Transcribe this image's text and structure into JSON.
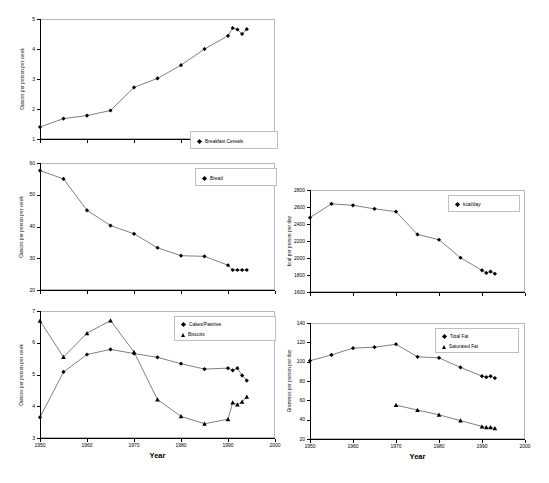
{
  "figure": {
    "title": "",
    "background": "#ffffff",
    "line_color": "#000000",
    "frame_color": "#b8b8b8"
  },
  "chart_data": [
    {
      "id": "breakfast-cereals",
      "type": "line",
      "title": "",
      "xlabel": "",
      "ylabel": "Ounces per person per week",
      "xlim": [
        1950,
        2000
      ],
      "ylim": [
        1,
        5
      ],
      "yticks": [
        1,
        2,
        3,
        4,
        5
      ],
      "xticks": [
        1950,
        1960,
        1970,
        1980,
        1990,
        2000
      ],
      "xtick_labels": [
        "",
        "",
        "",
        "",
        "",
        ""
      ],
      "grid": false,
      "legend_position": "bottom-right",
      "series": [
        {
          "name": "Breakfast Cereals",
          "marker": "diamond",
          "x": [
            1950,
            1955,
            1960,
            1965,
            1970,
            1975,
            1980,
            1985,
            1990,
            1991,
            1992,
            1993,
            1994
          ],
          "values": [
            1.4,
            1.68,
            1.78,
            1.95,
            2.72,
            3.02,
            3.46,
            4.0,
            4.44,
            4.7,
            4.65,
            4.5,
            4.66
          ]
        }
      ]
    },
    {
      "id": "bread",
      "type": "line",
      "title": "",
      "xlabel": "",
      "ylabel": "Ounces per person per week",
      "xlim": [
        1950,
        2000
      ],
      "ylim": [
        20,
        60
      ],
      "yticks": [
        20,
        30,
        40,
        50,
        60
      ],
      "xticks": [
        1950,
        1960,
        1970,
        1980,
        1990,
        2000
      ],
      "xtick_labels": [
        "",
        "",
        "",
        "",
        "",
        ""
      ],
      "grid": false,
      "legend_position": "top-right",
      "series": [
        {
          "name": "Bread",
          "marker": "diamond",
          "x": [
            1950,
            1955,
            1960,
            1965,
            1970,
            1975,
            1980,
            1985,
            1990,
            1991,
            1992,
            1993,
            1994
          ],
          "values": [
            57.6,
            55.0,
            45.1,
            40.3,
            37.7,
            33.3,
            30.8,
            30.6,
            27.8,
            26.3,
            26.3,
            26.3,
            26.3
          ]
        }
      ]
    },
    {
      "id": "cakes-biscuits",
      "type": "line",
      "title": "",
      "xlabel": "Year",
      "ylabel": "Ounces per person per week",
      "xlim": [
        1950,
        2000
      ],
      "ylim": [
        3,
        7
      ],
      "yticks": [
        3,
        4,
        5,
        6,
        7
      ],
      "xticks": [
        1950,
        1960,
        1970,
        1980,
        1990,
        2000
      ],
      "xtick_labels": [
        "1950",
        "1960",
        "1970",
        "1980",
        "1990",
        "2000"
      ],
      "grid": false,
      "legend_position": "top-right",
      "series": [
        {
          "name": "Cakes/Pastries",
          "marker": "diamond",
          "x": [
            1950,
            1955,
            1960,
            1965,
            1970,
            1975,
            1980,
            1985,
            1990,
            1991,
            1992,
            1993,
            1994
          ],
          "values": [
            3.65,
            5.08,
            5.63,
            5.79,
            5.66,
            5.54,
            5.34,
            5.17,
            5.2,
            5.13,
            5.2,
            4.97,
            4.81
          ]
        },
        {
          "name": "Biscuits",
          "marker": "triangle",
          "x": [
            1950,
            1955,
            1960,
            1965,
            1970,
            1975,
            1980,
            1985,
            1990,
            1991,
            1992,
            1993,
            1994
          ],
          "values": [
            6.69,
            5.55,
            6.3,
            6.7,
            5.71,
            4.21,
            3.68,
            3.45,
            3.59,
            4.12,
            4.05,
            4.14,
            4.3
          ]
        }
      ]
    },
    {
      "id": "energy-intake",
      "type": "line",
      "title": "",
      "xlabel": "",
      "ylabel": "kcal per person per day",
      "xlim": [
        1950,
        2000
      ],
      "ylim": [
        1600,
        2800
      ],
      "yticks": [
        1600,
        1800,
        2000,
        2200,
        2400,
        2600,
        2800
      ],
      "xticks": [
        1950,
        1960,
        1970,
        1980,
        1990,
        2000
      ],
      "xtick_labels": [
        "",
        "",
        "",
        "",
        "",
        ""
      ],
      "grid": false,
      "legend_position": "top-right",
      "series": [
        {
          "name": "kcal/day",
          "marker": "diamond",
          "x": [
            1950,
            1955,
            1960,
            1965,
            1970,
            1975,
            1980,
            1985,
            1990,
            1991,
            1992,
            1993
          ],
          "values": [
            2475,
            2637,
            2620,
            2578,
            2545,
            2277,
            2215,
            2003,
            1855,
            1825,
            1840,
            1815
          ]
        }
      ]
    },
    {
      "id": "fat-intake",
      "type": "line",
      "title": "",
      "xlabel": "Year",
      "ylabel": "Grammes per person per day",
      "xlim": [
        1950,
        2000
      ],
      "ylim": [
        20,
        140
      ],
      "yticks": [
        20,
        40,
        60,
        80,
        100,
        120,
        140
      ],
      "xticks": [
        1950,
        1960,
        1970,
        1980,
        1990,
        2000
      ],
      "xtick_labels": [
        "1950",
        "1960",
        "1970",
        "1980",
        "1990",
        "2000"
      ],
      "grid": false,
      "legend_position": "top-right",
      "series": [
        {
          "name": "Total Fat",
          "marker": "diamond",
          "x": [
            1950,
            1955,
            1960,
            1965,
            1970,
            1975,
            1980,
            1985,
            1990,
            1991,
            1992,
            1993
          ],
          "values": [
            101,
            107,
            114,
            115,
            118,
            105,
            104,
            94,
            85,
            84,
            85,
            83
          ]
        },
        {
          "name": "Saturated Fat",
          "marker": "triangle",
          "x": [
            1970,
            1975,
            1980,
            1985,
            1990,
            1991,
            1992,
            1993
          ],
          "values": [
            55,
            50,
            45,
            39,
            33,
            32,
            32,
            31
          ]
        }
      ]
    }
  ]
}
